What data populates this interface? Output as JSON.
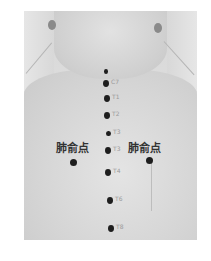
{
  "figure": {
    "labels": {
      "left_point": "肺俞点",
      "right_point": "肺俞点"
    },
    "spine_markers": [
      {
        "label": "",
        "x": 106,
        "y": 71,
        "r": 2
      },
      {
        "label": "C7",
        "x": 106,
        "y": 83,
        "r": 3
      },
      {
        "label": "T1",
        "x": 107,
        "y": 98,
        "r": 3
      },
      {
        "label": "T2",
        "x": 107,
        "y": 115,
        "r": 3
      },
      {
        "label": "T3",
        "x": 108,
        "y": 133,
        "r": 2.5
      },
      {
        "label": "T3",
        "x": 108,
        "y": 150,
        "r": 3
      },
      {
        "label": "T4",
        "x": 108,
        "y": 172,
        "r": 3
      },
      {
        "label": "T6",
        "x": 110,
        "y": 200,
        "r": 3
      },
      {
        "label": "T8",
        "x": 111,
        "y": 228,
        "r": 3
      }
    ],
    "acupoints": [
      {
        "name": "肺俞点",
        "side": "left",
        "x": 73,
        "y": 162
      },
      {
        "name": "肺俞点",
        "side": "right",
        "x": 149,
        "y": 160
      }
    ],
    "colors": {
      "dot": "#1e1e1e",
      "skin": "#d8d8d8",
      "background": "#ffffff"
    }
  }
}
